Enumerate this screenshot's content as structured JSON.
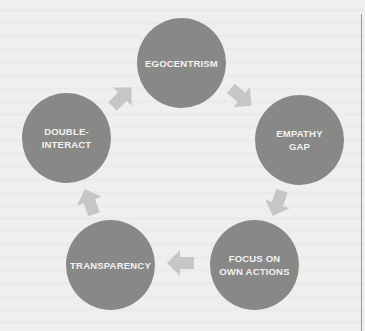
{
  "diagram": {
    "type": "cycle",
    "nodes": [
      {
        "id": "egocentrism",
        "label": "EGOCENTRISM"
      },
      {
        "id": "empathy-gap",
        "label": "EMPATHY\nGAP"
      },
      {
        "id": "focus-on-own-actions",
        "label": "FOCUS ON\nOWN ACTIONS"
      },
      {
        "id": "transparency",
        "label": "TRANSPARENCY"
      },
      {
        "id": "double-interact",
        "label": "DOUBLE-\nINTERACT"
      }
    ],
    "edges": [
      {
        "from": "egocentrism",
        "to": "empathy-gap"
      },
      {
        "from": "empathy-gap",
        "to": "focus-on-own-actions"
      },
      {
        "from": "focus-on-own-actions",
        "to": "transparency"
      },
      {
        "from": "transparency",
        "to": "double-interact"
      },
      {
        "from": "double-interact",
        "to": "egocentrism"
      }
    ],
    "colors": {
      "background": "#efefed",
      "node_fill": "#888887",
      "node_text": "#f2f2f2",
      "arrow_fill": "#c6c6c5"
    }
  }
}
